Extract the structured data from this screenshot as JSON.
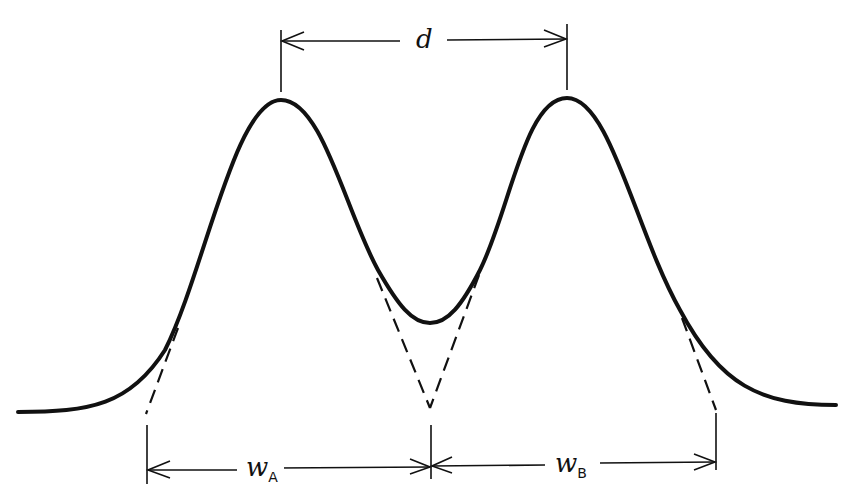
{
  "diagram": {
    "type": "chromatographic resolution of two peaks",
    "labels": {
      "d": "d",
      "wA_main": "w",
      "wA_sub": "A",
      "wB_main": "w",
      "wB_sub": "B"
    },
    "colors": {
      "ink": "#111111",
      "background": "#ffffff"
    },
    "peaks": [
      {
        "name": "A",
        "apex_x": 281,
        "apex_y": 100
      },
      {
        "name": "B",
        "apex_x": 567,
        "apex_y": 98
      }
    ],
    "valley": {
      "x": 430,
      "y": 323
    },
    "baseline_y": 410,
    "tangent_intercepts": {
      "A_left": 146,
      "A_right": 431,
      "B_left": 431,
      "B_right": 716
    },
    "dimensions": [
      {
        "label": "d",
        "from_x": 281,
        "to_x": 567,
        "y": 41
      },
      {
        "label": "wA",
        "from_x": 148,
        "to_x": 431,
        "y": 467
      },
      {
        "label": "wB",
        "from_x": 431,
        "to_x": 716,
        "y": 463
      }
    ]
  }
}
